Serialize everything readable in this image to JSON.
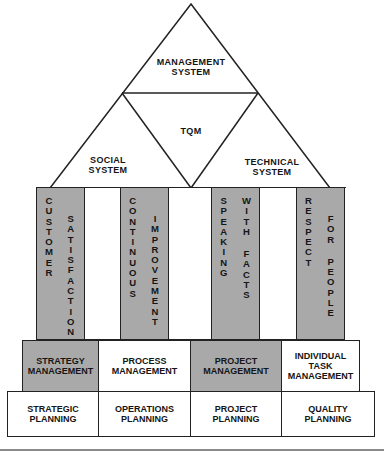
{
  "pyramid": {
    "top": "MANAGEMENT\nSYSTEM",
    "center": "TQM",
    "left": "SOCIAL\nSYSTEM",
    "right": "TECHNICAL\nSYSTEM"
  },
  "pillars": [
    {
      "words": [
        "CUSTOMER",
        "SATISFACTION"
      ],
      "fill": "gray"
    },
    {
      "words": [
        "CONTINUOUS",
        "IMPROVEMENT"
      ],
      "fill": "gray"
    },
    {
      "words": [
        "SPEAKING",
        "WITH FACTS"
      ],
      "fill": "gray"
    },
    {
      "words": [
        "RESPECT",
        "FOR PEOPLE"
      ],
      "fill": "gray"
    }
  ],
  "management_row": [
    {
      "label": "STRATEGY\nMANAGEMENT",
      "fill": "gray"
    },
    {
      "label": "PROCESS\nMANAGEMENT",
      "fill": "white"
    },
    {
      "label": "PROJECT\nMANAGEMENT",
      "fill": "gray"
    },
    {
      "label": "INDIVIDUAL\nTASK\nMANAGEMENT",
      "fill": "white"
    }
  ],
  "planning_row": [
    {
      "label": "STRATEGIC\nPLANNING"
    },
    {
      "label": "OPERATIONS\nPLANNING"
    },
    {
      "label": "PROJECT\nPLANNING"
    },
    {
      "label": "QUALITY\nPLANNING"
    }
  ],
  "colors": {
    "gray_fill": "#a9a9a9",
    "line": "#222222",
    "rule": "#8a8a8a"
  }
}
